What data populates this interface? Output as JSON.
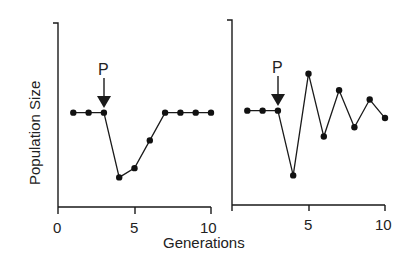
{
  "chart_data": [
    {
      "type": "line",
      "panel": "left",
      "title": "",
      "xlabel": "Generations",
      "ylabel": "Population Size",
      "x": [
        1,
        2,
        3,
        4,
        5,
        6,
        7,
        8,
        9,
        10
      ],
      "series": [
        {
          "name": "Population",
          "values": [
            51,
            51,
            51,
            16,
            21,
            36,
            51,
            51,
            51,
            51
          ]
        }
      ],
      "xlim": [
        0,
        10
      ],
      "ylim": [
        0,
        100
      ],
      "xticks": [
        0,
        5,
        10
      ],
      "yticks": [],
      "grid": false,
      "annotations": [
        {
          "text": "P",
          "x": 3,
          "type": "arrow-down",
          "meaning": "perturbation"
        }
      ]
    },
    {
      "type": "line",
      "panel": "right",
      "title": "",
      "xlabel": "Generations",
      "ylabel": "Population Size",
      "x": [
        1,
        2,
        3,
        4,
        5,
        6,
        7,
        8,
        9,
        10
      ],
      "series": [
        {
          "name": "Population",
          "values": [
            51,
            51,
            51,
            16,
            71,
            37,
            62,
            42,
            57,
            47
          ]
        }
      ],
      "xlim": [
        0,
        10
      ],
      "ylim": [
        0,
        100
      ],
      "xticks": [
        5,
        10
      ],
      "yticks": [],
      "grid": false,
      "annotations": [
        {
          "text": "P",
          "x": 3,
          "type": "arrow-down",
          "meaning": "perturbation"
        }
      ]
    }
  ],
  "labels": {
    "ylabel": "Population Size",
    "xlabel": "Generations",
    "marker": "P",
    "left_ticks": [
      "0",
      "5",
      "10"
    ],
    "right_ticks": [
      "5",
      "10"
    ]
  }
}
